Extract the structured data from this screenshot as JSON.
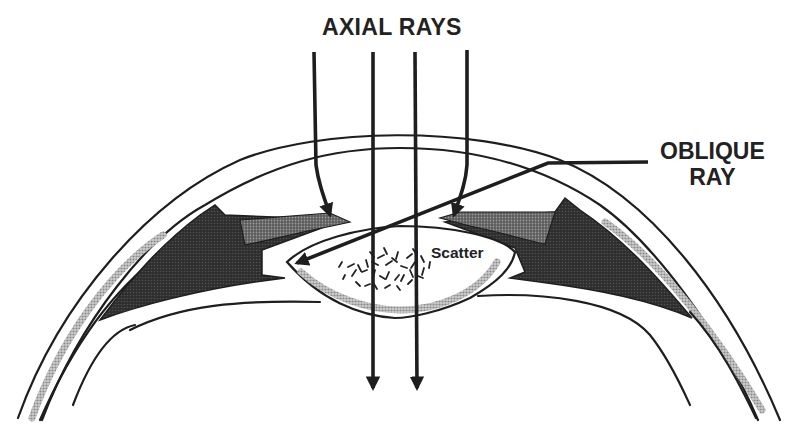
{
  "figure": {
    "title": "AXIAL RAYS",
    "labels": {
      "axial_rays": "AXIAL RAYS",
      "oblique_ray_line1": "OBLIQUE",
      "oblique_ray_line2": "RAY",
      "scatter": "Scatter"
    },
    "structures": [
      "cornea",
      "iris",
      "ciliary-body",
      "lens",
      "sclera",
      "scatter-region"
    ],
    "rays": {
      "axial_count": 4,
      "oblique_count": 1
    },
    "colors": {
      "ink": "#1e1e1e",
      "ciliary_body": "#2b2b2b",
      "iris_stipple": "#6e6e6e",
      "stipple_band": "#9a9a9a",
      "background": "#ffffff"
    }
  }
}
